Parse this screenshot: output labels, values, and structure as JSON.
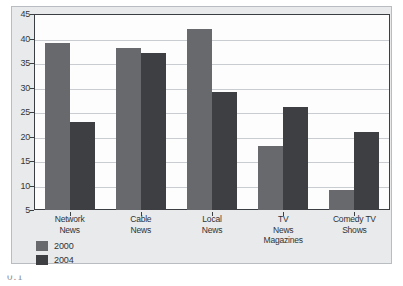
{
  "chart_data": {
    "type": "bar",
    "title": "",
    "subtitle": "",
    "xlabel": "",
    "ylabel": "",
    "categories": [
      "Network News",
      "Cable News",
      "Local News",
      "TV News Magazines",
      "Comedy TV Shows"
    ],
    "category_lines": [
      [
        "Network",
        "News"
      ],
      [
        "Cable",
        "News"
      ],
      [
        "Local",
        "News"
      ],
      [
        "TV",
        "News",
        "Magazines"
      ],
      [
        "Comedy TV",
        "Shows"
      ]
    ],
    "series": [
      {
        "name": "2000",
        "color": "#67696c",
        "values": [
          39,
          38,
          42,
          18,
          9
        ]
      },
      {
        "name": "2004",
        "color": "#3d3f42",
        "values": [
          23,
          37,
          29,
          26,
          21
        ]
      }
    ],
    "ylim": [
      5,
      45
    ],
    "yticks": [
      5,
      10,
      15,
      20,
      25,
      30,
      35,
      40,
      45
    ],
    "ytick_labels": [
      "5",
      "10",
      "15",
      "20",
      "25",
      "30",
      "35",
      "40",
      "45"
    ],
    "grid": true,
    "grid_axis": "y",
    "legend_position": "bottom-left",
    "legend_entries": [
      "2000",
      "2004"
    ],
    "bar_group_mode": "grouped",
    "annotations": []
  },
  "figure": {
    "panel_background": "#e9eaeb",
    "plot_background": "#fdfdfe",
    "axis_color": "#3b3f44",
    "gridline_color": "#c9ccd0",
    "caption_fragment": "0.1"
  }
}
